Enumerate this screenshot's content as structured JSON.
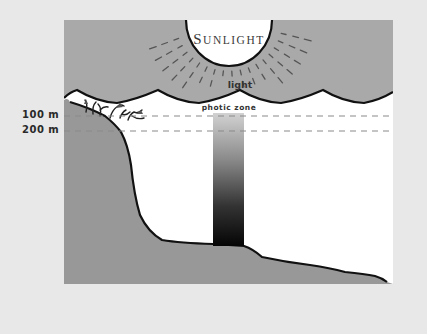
{
  "diagram": {
    "sun_label_first": "S",
    "sun_label_rest": "UNLIGHT",
    "light_label": "light",
    "zone_label": "photic zone",
    "depth_markers": [
      {
        "label": "100 m",
        "y": 116
      },
      {
        "label": "200 m",
        "y": 131
      }
    ],
    "colors": {
      "page_background": "#e8e8e8",
      "sky": "#a9a9a9",
      "water": "#ffffff",
      "land": "#989898",
      "outline": "#111111",
      "ray": "#555555",
      "dash": "#999999",
      "gradient_top": "#c8c8c8",
      "gradient_bottom": "#0a0a0a"
    }
  }
}
